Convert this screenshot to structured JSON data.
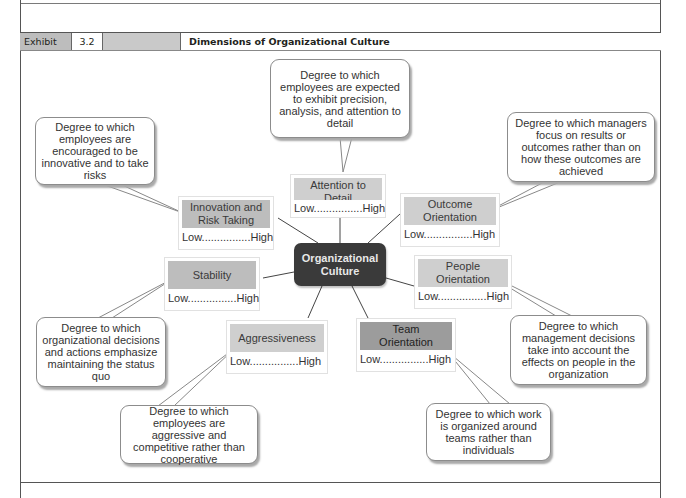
{
  "exhibit": {
    "label": "Exhibit",
    "number": "3.2",
    "title": "Dimensions of Organizational Culture"
  },
  "center": {
    "line1": "Organizational",
    "line2": "Culture"
  },
  "scale_label": "Low................High",
  "dimensions": {
    "attention": {
      "name_line1": "Attention to",
      "name_line2": "Detail",
      "scale": "Low................High",
      "description": "Degree to which employees are expected to exhibit precision, analysis, and attention to detail"
    },
    "innovation": {
      "name_line1": "Innovation and",
      "name_line2": "Risk Taking",
      "scale": "Low................High",
      "description": "Degree to which employees are encouraged to be innovative and to take risks"
    },
    "outcome": {
      "name_line1": "Outcome",
      "name_line2": "Orientation",
      "scale": "Low................High",
      "description": "Degree to which managers focus on results or outcomes rather than on how these outcomes are achieved"
    },
    "stability": {
      "name_line1": "Stability",
      "scale": "Low................High",
      "description": "Degree to which organizational decisions and actions emphasize maintaining the status quo"
    },
    "people": {
      "name_line1": "People",
      "name_line2": "Orientation",
      "scale": "Low................High",
      "description": "Degree to which management decisions take into account the effects on people in the organization"
    },
    "aggressiveness": {
      "name_line1": "Aggressiveness",
      "scale": "Low................High",
      "description": "Degree to which employees are aggressive and competitive rather than cooperative"
    },
    "team": {
      "name_line1": "Team",
      "name_line2": "Orientation",
      "scale": "Low................High",
      "description": "Degree to which work is organized around teams rather than individuals"
    }
  },
  "colors": {
    "center_fill": "#3a3a3a",
    "dimension_fill_light": "#cfcfcf",
    "dimension_fill_medium": "#bdbdbd",
    "dimension_fill_dark": "#9c9c9c",
    "exhibit_label_fill": "#bdbdbd"
  }
}
